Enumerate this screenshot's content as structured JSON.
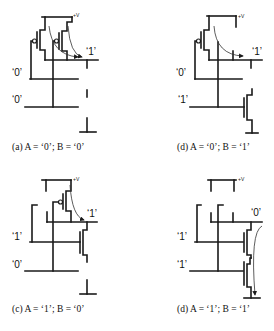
{
  "figure": {
    "panels": [
      {
        "id": "a",
        "caption_prefix": "(a) ",
        "caption": "A = ‘0’; B = ‘0’",
        "caption_full": "(a) A = ‘0’; B = ‘0’",
        "vdd_label": "+V",
        "output_label": "‘1’",
        "input_a_label": "‘0’",
        "input_b_label": "‘0’"
      },
      {
        "id": "d1",
        "caption_full": "(d) A = ‘0’; B = ‘1’",
        "vdd_label": "+V",
        "output_label": "‘1’",
        "input_a_label": "‘0’",
        "input_b_label": "‘1’"
      },
      {
        "id": "c",
        "caption_full": "(c) A = ‘1’; B = ‘0’",
        "vdd_label": "+V",
        "output_label": "‘1’",
        "input_a_label": "‘1’",
        "input_b_label": "‘0’"
      },
      {
        "id": "d2",
        "caption_full": "(d) A = ‘1’; B = ‘1’",
        "vdd_label": "+V",
        "output_label": "‘0’",
        "input_a_label": "‘1’",
        "input_b_label": "‘1’"
      }
    ],
    "colors": {
      "line": "#1a1a1a",
      "background": "#ffffff"
    }
  }
}
